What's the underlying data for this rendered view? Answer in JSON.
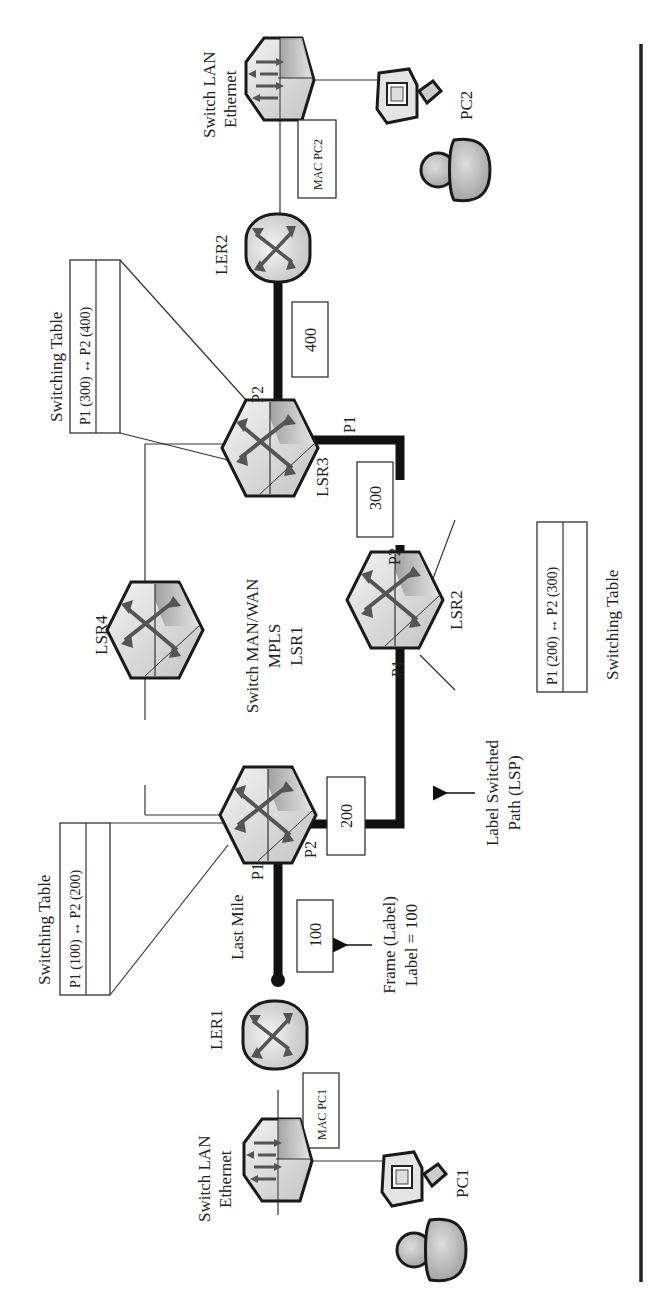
{
  "figure": {
    "orientation": "rotated 90 degrees counter-clockwise",
    "rule_color": "#222222",
    "lsp_color": "#111111"
  },
  "devices": {
    "switch_lan_2": {
      "label_line1": "Switch LAN",
      "label_line2": "Ethernet"
    },
    "pc2": {
      "label": "PC2"
    },
    "mac_pc2": {
      "label": "MAC PC2"
    },
    "ler2": {
      "label": "LER2"
    },
    "lsr3": {
      "label": "LSR3",
      "port_p1": "P1",
      "port_p2": "P2"
    },
    "lsr4": {
      "label": "LSR4"
    },
    "lsr2": {
      "label": "LSR2",
      "port_p1": "P1",
      "port_p2": "P2"
    },
    "lsr1": {
      "label_line1": "Switch MAN/WAN",
      "label_line2": "MPLS",
      "label_line3": "LSR1",
      "port_p1": "P1",
      "port_p2": "P2"
    },
    "ler1": {
      "label": "LER1"
    },
    "switch_lan_1": {
      "label_line1": "Switch LAN",
      "label_line2": "Ethernet"
    },
    "mac_pc1": {
      "label": "MAC PC1"
    },
    "pc1": {
      "label": "PC1"
    }
  },
  "switching_tables": [
    {
      "title": "Switching Table",
      "entry": "P1 (300) ↔ P2 (400)",
      "device": "LSR3"
    },
    {
      "title": "Switching Table",
      "entry": "P1 (200) ↔ P2 (300)",
      "device": "LSR2"
    },
    {
      "title": "Switching Table",
      "entry": "P1 (100) ↔ P2 (200)",
      "device": "LSR1"
    }
  ],
  "labels_on_path": [
    "400",
    "300",
    "200",
    "100"
  ],
  "annotations": {
    "last_mile": "Last Mile",
    "frame_line1": "Frame (Label)",
    "frame_line2": "Label = 100",
    "lsp_line1": "Label Switched",
    "lsp_line2": "Path (LSP)"
  }
}
